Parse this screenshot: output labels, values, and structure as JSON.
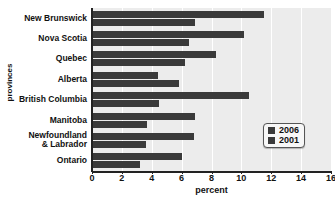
{
  "chart_data": {
    "type": "bar",
    "orientation": "horizontal",
    "title": "",
    "xlabel": "percent",
    "ylabel": "provinces",
    "xlim": [
      0,
      16
    ],
    "xticks": [
      0,
      2,
      4,
      6,
      8,
      10,
      12,
      14,
      16
    ],
    "grid": true,
    "legend_position": "center-right",
    "categories": [
      "New Brunswick",
      "Nova Scotia",
      "Quebec",
      "Alberta",
      "British Columbia",
      "Manitoba",
      "Newfoundland\n& Labrador",
      "Ontario"
    ],
    "series": [
      {
        "name": "2006",
        "color": "#3a3a3a",
        "values": [
          11.5,
          10.2,
          8.3,
          4.4,
          10.5,
          6.9,
          6.8,
          6.0
        ]
      },
      {
        "name": "2001",
        "color": "#3a3a3a",
        "values": [
          6.9,
          6.5,
          6.2,
          5.8,
          4.5,
          3.7,
          3.6,
          3.2
        ]
      }
    ]
  },
  "legend": {
    "items": [
      {
        "label": "2006",
        "color": "#3a3a3a"
      },
      {
        "label": "2001",
        "color": "#3a3a3a"
      }
    ]
  },
  "colors": {
    "bar": "#3a3a3a",
    "plot_background": "#ececec",
    "gridline": "#ffffff",
    "axis": "#222222",
    "page_background": "#ffffff"
  }
}
